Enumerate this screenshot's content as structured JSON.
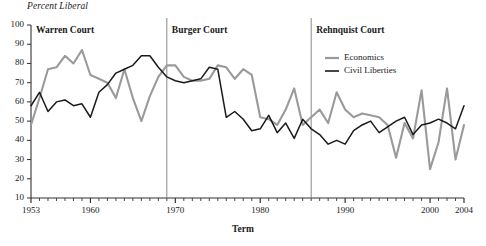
{
  "chart_data": {
    "type": "line",
    "title": "",
    "ylabel": "Percent Liberal",
    "xlabel": "Term",
    "ylim": [
      10,
      100
    ],
    "xlim": [
      1953,
      2004
    ],
    "ytick_labels": [
      "100",
      "90",
      "80",
      "70",
      "60",
      "50",
      "40",
      "30",
      "20",
      "10"
    ],
    "ytick_values": [
      100,
      90,
      80,
      70,
      60,
      50,
      40,
      30,
      20,
      10
    ],
    "xtick_labels": [
      "1953",
      "1960",
      "1970",
      "1980",
      "1990",
      "2000",
      "2004"
    ],
    "xtick_values": [
      1953,
      1960,
      1970,
      1980,
      1990,
      2000,
      2004
    ],
    "grid": false,
    "legend_position": "top-right",
    "x": [
      1953,
      1954,
      1955,
      1956,
      1957,
      1958,
      1959,
      1960,
      1961,
      1962,
      1963,
      1964,
      1965,
      1966,
      1967,
      1968,
      1969,
      1970,
      1971,
      1972,
      1973,
      1974,
      1975,
      1976,
      1977,
      1978,
      1979,
      1980,
      1981,
      1982,
      1983,
      1984,
      1985,
      1986,
      1987,
      1988,
      1989,
      1990,
      1991,
      1992,
      1993,
      1994,
      1995,
      1996,
      1997,
      1998,
      1999,
      2000,
      2001,
      2002,
      2003,
      2004
    ],
    "series": [
      {
        "name": "Economics",
        "color": "#9a9a9a",
        "values": [
          48,
          62,
          77,
          78,
          84,
          80,
          87,
          74,
          72,
          70,
          62,
          77,
          62,
          50,
          63,
          73,
          79,
          79,
          73,
          71,
          71,
          72,
          79,
          78,
          72,
          77,
          74,
          52,
          51,
          48,
          56,
          67,
          48,
          52,
          56,
          49,
          65,
          56,
          52,
          54,
          53,
          52,
          48,
          31,
          49,
          41,
          66,
          25,
          39,
          67,
          30,
          48
        ]
      },
      {
        "name": "Civil Liberties",
        "color": "#1a1a1a",
        "values": [
          58,
          65,
          55,
          60,
          61,
          58,
          59,
          52,
          65,
          69,
          75,
          77,
          79,
          84,
          84,
          78,
          73,
          71,
          70,
          71,
          72,
          78,
          77,
          52,
          55,
          51,
          45,
          46,
          53,
          44,
          49,
          41,
          51,
          46,
          43,
          38,
          40,
          38,
          45,
          48,
          50,
          44,
          47,
          50,
          52,
          43,
          48,
          49,
          51,
          49,
          46,
          58
        ]
      }
    ],
    "era_markers": [
      {
        "label": "Warren Court",
        "start_year": 1953,
        "divider_year": null
      },
      {
        "label": "Burger Court",
        "start_year": 1969,
        "divider_year": 1969
      },
      {
        "label": "Rehnquist Court",
        "start_year": 1986,
        "divider_year": 1986
      }
    ],
    "divider_color": "#8a8a8a"
  },
  "legend": {
    "items": [
      {
        "label": "Economics",
        "color": "#9a9a9a"
      },
      {
        "label": "Civil Liberties",
        "color": "#1a1a1a"
      }
    ]
  }
}
